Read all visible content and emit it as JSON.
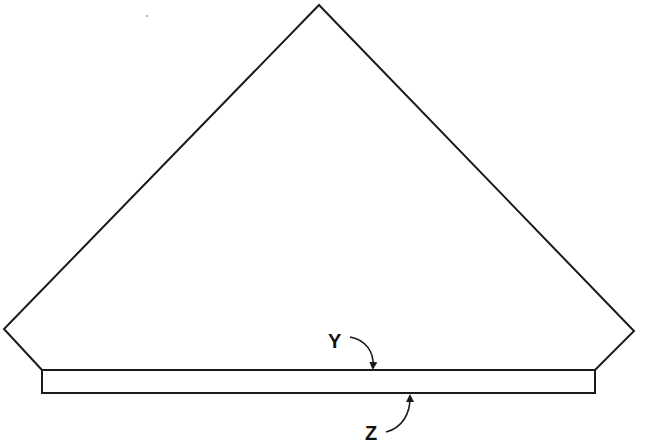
{
  "diagram": {
    "stroke_color": "#1a1a1a",
    "background": "#ffffff",
    "labels": {
      "top_surface": "Y",
      "bottom_surface": "Z"
    },
    "annotations": [
      {
        "label": "Y",
        "points_to": "top edge of strip"
      },
      {
        "label": "Z",
        "points_to": "bottom edge of strip"
      }
    ]
  }
}
